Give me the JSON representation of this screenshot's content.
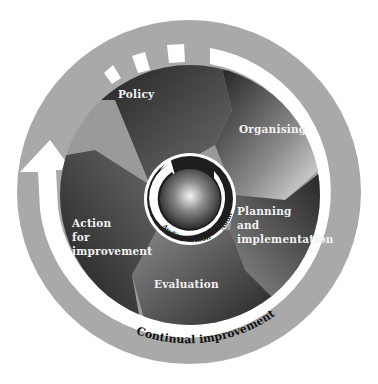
{
  "diagram": {
    "outer_ring_label": "Continual improvement",
    "segments": [
      {
        "label": "Policy"
      },
      {
        "label": "Organising"
      },
      {
        "label_lines": [
          "Planning",
          "and",
          "implementation"
        ]
      },
      {
        "label": "Evaluation"
      },
      {
        "label_lines": [
          "Action",
          "for",
          "improvement"
        ]
      }
    ],
    "center": {
      "audit_labels": [
        "Audit",
        "Audit",
        "Audit"
      ]
    },
    "colors": {
      "outer_ring": "#a9a9a9",
      "arrow_band": "#ffffff",
      "segment_dark": "#2a2a2a",
      "segment_mid": "#7a7a7a",
      "segment_light": "#d8d8d8",
      "center_ring": "#1e1e1e"
    }
  }
}
